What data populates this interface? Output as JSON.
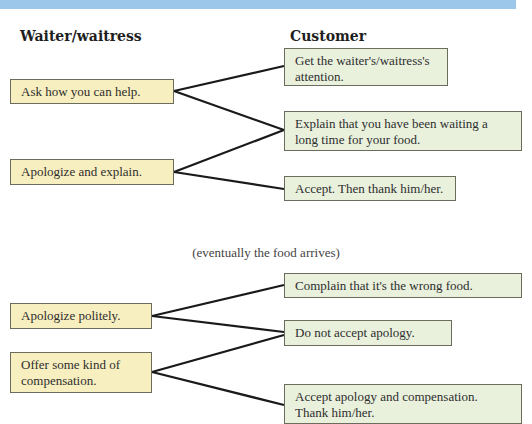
{
  "headers": {
    "waiter": "Waiter/waitress",
    "customer": "Customer"
  },
  "section1": {
    "waiter": [
      "Ask how you can help.",
      "Apologize and explain."
    ],
    "customer": [
      "Get the waiter's/waitress's attention.",
      "Explain that you have been waiting a long time for your food.",
      "Accept. Then thank him/her."
    ]
  },
  "caption": "(eventually the food arrives)",
  "section2": {
    "waiter": [
      "Apologize politely.",
      "Offer some kind of compensation."
    ],
    "customer": [
      "Complain that it's the wrong food.",
      "Do not accept apology.",
      "Accept apology and compensation. Thank him/her."
    ]
  },
  "colors": {
    "banner": "#9cc6ea",
    "waiter_box": "#f8efc0",
    "customer_box": "#e9f1dd",
    "line": "#1a1a1a"
  }
}
